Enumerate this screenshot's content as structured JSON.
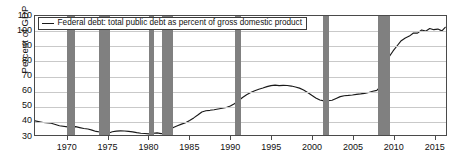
{
  "chart_data": {
    "type": "line",
    "title": "",
    "subtitle": "",
    "xlabel": "",
    "ylabel": "Percent of GDP",
    "xlim": [
      1966.0,
      2016.5
    ],
    "ylim": [
      30,
      110
    ],
    "grid": true,
    "legend_position": "top-left-inside",
    "y_ticks": [
      110,
      100,
      90,
      80,
      70,
      60,
      50,
      40,
      30
    ],
    "x_ticks": [
      1970,
      1975,
      1980,
      1985,
      1990,
      1995,
      2000,
      2005,
      2010,
      2015
    ],
    "legend": [
      "Federal debt: total public debt as percent of gross domestic product"
    ],
    "series": [
      {
        "name": "Federal debt: total public debt as percent of gross domestic product",
        "color": "#1a1a1a",
        "x": [
          1966.0,
          1967.0,
          1968.0,
          1969.0,
          1970.0,
          1970.5,
          1971.0,
          1971.5,
          1972.0,
          1972.5,
          1973.0,
          1973.5,
          1974.0,
          1974.5,
          1975.0,
          1975.5,
          1976.0,
          1976.5,
          1977.0,
          1977.5,
          1978.0,
          1978.5,
          1979.0,
          1979.5,
          1980.0,
          1980.5,
          1981.0,
          1981.5,
          1982.0,
          1982.5,
          1983.0,
          1983.5,
          1984.0,
          1984.5,
          1985.0,
          1985.5,
          1986.0,
          1986.5,
          1987.0,
          1987.5,
          1988.0,
          1988.5,
          1989.0,
          1989.5,
          1990.0,
          1990.5,
          1991.0,
          1991.5,
          1992.0,
          1992.5,
          1993.0,
          1993.5,
          1994.0,
          1994.5,
          1995.0,
          1995.5,
          1996.0,
          1996.5,
          1997.0,
          1997.5,
          1998.0,
          1998.5,
          1999.0,
          1999.5,
          2000.0,
          2000.5,
          2001.0,
          2001.5,
          2002.0,
          2002.5,
          2003.0,
          2003.5,
          2004.0,
          2004.5,
          2005.0,
          2005.5,
          2006.0,
          2006.5,
          2007.0,
          2007.5,
          2008.0,
          2008.5,
          2009.0,
          2009.5,
          2010.0,
          2010.5,
          2011.0,
          2011.5,
          2012.0,
          2012.5,
          2013.0,
          2013.5,
          2014.0,
          2014.5,
          2015.0,
          2015.5,
          2016.0,
          2016.4
        ],
        "y": [
          39.5,
          38.4,
          37.9,
          36.2,
          35.5,
          35.4,
          35.6,
          35.0,
          34.4,
          34.0,
          33.3,
          32.4,
          32.0,
          31.4,
          31.2,
          32.2,
          32.6,
          32.8,
          32.7,
          32.4,
          32.1,
          31.6,
          31.2,
          31.0,
          30.8,
          31.2,
          31.4,
          30.9,
          31.2,
          33.3,
          35.0,
          36.2,
          37.3,
          38.2,
          39.8,
          41.5,
          43.4,
          45.5,
          46.3,
          46.6,
          47.0,
          47.5,
          48.0,
          48.5,
          49.5,
          51.0,
          53.0,
          55.2,
          57.0,
          58.5,
          59.8,
          60.8,
          61.6,
          62.5,
          63.2,
          63.5,
          63.2,
          63.4,
          63.3,
          62.9,
          62.3,
          61.5,
          60.3,
          58.6,
          56.7,
          54.9,
          53.5,
          52.9,
          53.0,
          53.4,
          54.6,
          55.8,
          56.4,
          56.6,
          56.9,
          57.3,
          57.6,
          58.0,
          58.6,
          59.4,
          60.0,
          63.0,
          76.0,
          82.5,
          86.5,
          90.0,
          93.4,
          95.2,
          96.5,
          98.6,
          98.5,
          100.6,
          99.8,
          101.6,
          100.8,
          101.2,
          100.0,
          102.4
        ]
      }
    ],
    "recession_bands": [
      {
        "start": 1969.9,
        "end": 1970.9
      },
      {
        "start": 1973.8,
        "end": 1975.2
      },
      {
        "start": 1980.0,
        "end": 1980.5
      },
      {
        "start": 1981.5,
        "end": 1982.9
      },
      {
        "start": 1990.5,
        "end": 1991.2
      },
      {
        "start": 2001.2,
        "end": 2001.9
      },
      {
        "start": 2007.9,
        "end": 2009.4
      }
    ],
    "band_color": "#808080",
    "grid_color": "#c9c9c9",
    "frame_color": "#4a4a4a"
  }
}
